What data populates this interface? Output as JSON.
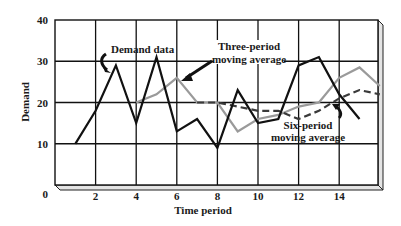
{
  "chart_data": {
    "type": "line",
    "title": "",
    "xlabel": "Time period",
    "ylabel": "Demand",
    "xlim": [
      0,
      15.8
    ],
    "ylim": [
      0,
      40
    ],
    "x_ticks": [
      2,
      4,
      6,
      8,
      10,
      12,
      14
    ],
    "y_ticks": [
      0,
      10,
      20,
      30,
      40
    ],
    "grid": true,
    "legend_position": "inline annotations",
    "series": [
      {
        "name": "Demand data",
        "style": "solid",
        "color": "#111111",
        "x": [
          1,
          2,
          3,
          4,
          5,
          6,
          7,
          8,
          9,
          10,
          11,
          12,
          13,
          14,
          15
        ],
        "values": [
          10,
          18,
          29,
          15,
          31,
          13,
          16,
          9,
          23,
          15,
          16,
          29,
          31,
          22,
          16
        ]
      },
      {
        "name": "Three-period moving average",
        "style": "solid",
        "color": "#9a9a9a",
        "x": [
          4,
          5,
          6,
          7,
          8,
          9,
          10,
          11,
          12,
          13,
          14,
          15,
          16
        ],
        "values": [
          20,
          22,
          26,
          20,
          20,
          13,
          16,
          17,
          19,
          20,
          26,
          28.5,
          24
        ]
      },
      {
        "name": "Six-period moving average",
        "style": "dashed",
        "color": "#3a3a3a",
        "x": [
          7,
          8,
          9,
          10,
          11,
          12,
          13,
          14,
          15,
          16
        ],
        "values": [
          20,
          20,
          19,
          18,
          18,
          16,
          18,
          21,
          23,
          22
        ]
      }
    ],
    "annotations": [
      {
        "text": "Demand data",
        "lines": [
          "Demand data"
        ]
      },
      {
        "text": "Three-period moving average",
        "lines": [
          "Three-period",
          "moving average"
        ]
      },
      {
        "text": "Six-period moving average",
        "lines": [
          "Six-period",
          "moving average"
        ]
      }
    ]
  },
  "labels": {
    "y_axis": "Demand",
    "x_axis": "Time period",
    "annot_demand": "Demand data",
    "annot_three_1": "Three-period",
    "annot_three_2": "moving average",
    "annot_six_1": "Six-period",
    "annot_six_2": "moving average"
  },
  "colors": {
    "grid": "#111111",
    "demand": "#111111",
    "ma3": "#9a9a9a",
    "ma6": "#3a3a3a",
    "bevel": "#e4e4e4"
  }
}
